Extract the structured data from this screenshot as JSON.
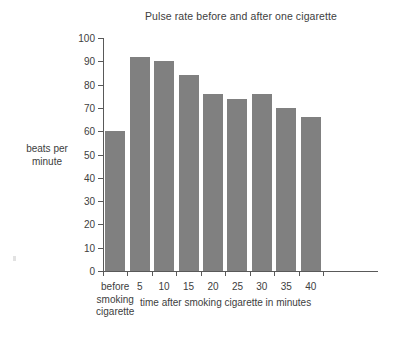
{
  "chart_data": {
    "type": "bar",
    "title": "Pulse rate before and after one cigarette",
    "xlabel": "time after smoking cigarette in minutes",
    "ylabel": "beats per minute",
    "ylabel_lines": [
      "beats per",
      "minute"
    ],
    "categories": [
      "before smoking cigarette",
      "5",
      "10",
      "15",
      "20",
      "25",
      "30",
      "35",
      "40"
    ],
    "category_lines": [
      [
        "before",
        "smoking",
        "cigarette"
      ],
      [
        "5"
      ],
      [
        "10"
      ],
      [
        "15"
      ],
      [
        "20"
      ],
      [
        "25"
      ],
      [
        "30"
      ],
      [
        "35"
      ],
      [
        "40"
      ]
    ],
    "values": [
      60,
      92,
      90,
      84,
      76,
      74,
      76,
      70,
      66
    ],
    "ylim": [
      0,
      100
    ],
    "ytick_step": 10,
    "yticks": [
      0,
      10,
      20,
      30,
      40,
      50,
      60,
      70,
      80,
      90,
      100
    ],
    "grid": false,
    "legend": null,
    "bar_color": "#808080",
    "axis_color": "#595959",
    "text_color": "#404040",
    "background": "#ffffff"
  }
}
